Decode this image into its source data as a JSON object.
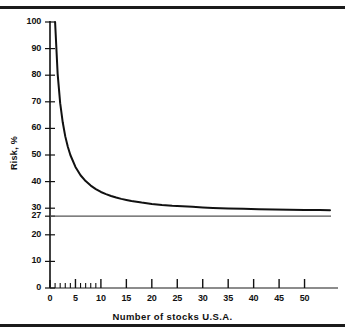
{
  "figure": {
    "background_color": "#ffffff",
    "ink_color": "#111111",
    "top_rule": "",
    "bottom_rule": ""
  },
  "chart_data": {
    "type": "line",
    "title": "",
    "subtitle": "",
    "xlabel": "Number of stocks U.S.A.",
    "ylabel": "Risk, %",
    "xlim": [
      0,
      55
    ],
    "ylim": [
      0,
      100
    ],
    "grid": false,
    "legend": "none",
    "x_major_ticks": [
      0,
      5,
      10,
      15,
      20,
      25,
      30,
      35,
      40,
      45,
      50
    ],
    "x_tick_labels": [
      "0",
      "5",
      "10",
      "15",
      "20",
      "25",
      "30",
      "35",
      "40",
      "45",
      "50"
    ],
    "x_minor_ticks": [
      1,
      2,
      3,
      4,
      6,
      7,
      8,
      9
    ],
    "y_major_ticks": [
      0,
      10,
      20,
      27,
      30,
      40,
      50,
      60,
      70,
      80,
      90,
      100
    ],
    "y_tick_labels": [
      "0",
      "10",
      "20",
      "27",
      "30",
      "40",
      "50",
      "60",
      "70",
      "80",
      "90",
      "100"
    ],
    "series": [
      {
        "name": "Portfolio risk",
        "line_color": "#111111",
        "line_width": 2.0,
        "x": [
          1,
          1.5,
          2,
          2.5,
          3,
          3.5,
          4,
          5,
          6,
          7,
          8,
          9,
          10,
          11,
          12,
          13,
          14,
          15,
          16,
          18,
          20,
          22,
          24,
          26,
          28,
          30,
          32,
          35,
          38,
          41,
          44,
          47,
          50,
          53,
          55
        ],
        "y": [
          100,
          80.5,
          69.5,
          62.3,
          57.0,
          53.1,
          50.0,
          45.5,
          42.4,
          40.2,
          38.5,
          37.2,
          36.1,
          35.3,
          34.6,
          34.0,
          33.5,
          33.1,
          32.7,
          32.1,
          31.6,
          31.2,
          30.9,
          30.7,
          30.5,
          30.3,
          30.1,
          29.9,
          29.8,
          29.6,
          29.5,
          29.4,
          29.3,
          29.3,
          29.2
        ]
      }
    ],
    "reference_lines": [
      {
        "name": "systematic-risk-asymptote",
        "orientation": "horizontal",
        "value": 27,
        "label": "27",
        "color": "#555555",
        "line_width": 1.2
      }
    ],
    "annotations": []
  }
}
